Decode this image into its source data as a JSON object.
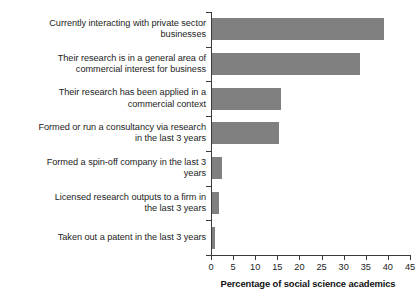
{
  "chart_data": {
    "type": "bar",
    "orientation": "horizontal",
    "title": "",
    "xlabel": "Percentage of social science academics",
    "ylabel": "",
    "xlim": [
      0,
      45
    ],
    "xticks": [
      0,
      5,
      10,
      15,
      20,
      25,
      30,
      35,
      40,
      45
    ],
    "grid": false,
    "legend": false,
    "bar_color": "#808080",
    "axis_color": "#3a3a3a",
    "categories": [
      "Currently interacting with private sector\nbusinesses",
      "Their research is in a general area of\ncommercial interest for business",
      "Their research has been applied in a\ncommercial context",
      "Formed or run a consultancy via research\nin the last 3 years",
      "Formed a spin-off company in the last 3\nyears",
      "Licensed research outputs to a firm in\nthe last 3 years",
      "Taken out a patent in the last 3 years"
    ],
    "values": [
      39.2,
      33.6,
      15.8,
      15.4,
      2.4,
      1.8,
      0.9
    ]
  }
}
